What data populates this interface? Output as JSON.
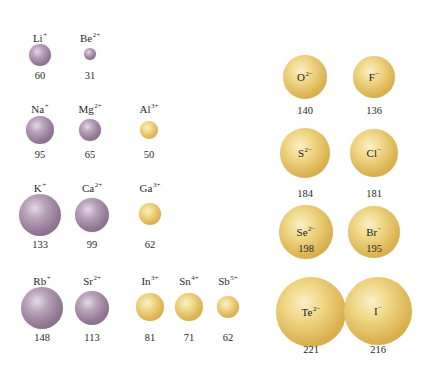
{
  "chart_data": {
    "type": "diagram",
    "title": "",
    "units": "pm",
    "cations": [
      {
        "symbol": "Li",
        "charge": "+",
        "radius": 60,
        "color": "purple",
        "x": 40,
        "y": 55,
        "r": 11,
        "label_y": 32,
        "value_y": 71
      },
      {
        "symbol": "Be",
        "charge": "2+",
        "radius": 31,
        "color": "purple",
        "x": 90,
        "y": 54,
        "r": 6,
        "label_y": 32,
        "value_y": 71
      },
      {
        "symbol": "Na",
        "charge": "+",
        "radius": 95,
        "color": "purple",
        "x": 40,
        "y": 130,
        "r": 14,
        "label_y": 103,
        "value_y": 150
      },
      {
        "symbol": "Mg",
        "charge": "2+",
        "radius": 65,
        "color": "purple",
        "x": 90,
        "y": 130,
        "r": 11,
        "label_y": 103,
        "value_y": 150
      },
      {
        "symbol": "Al",
        "charge": "3+",
        "radius": 50,
        "color": "gold",
        "x": 149,
        "y": 130,
        "r": 9,
        "label_y": 103,
        "value_y": 150
      },
      {
        "symbol": "K",
        "charge": "+",
        "radius": 133,
        "color": "purple",
        "x": 40,
        "y": 215,
        "r": 21,
        "label_y": 182,
        "value_y": 240
      },
      {
        "symbol": "Ca",
        "charge": "2+",
        "radius": 99,
        "color": "purple",
        "x": 92,
        "y": 215,
        "r": 17,
        "label_y": 182,
        "value_y": 240
      },
      {
        "symbol": "Ga",
        "charge": "3+",
        "radius": 62,
        "color": "gold",
        "x": 150,
        "y": 214,
        "r": 11,
        "label_y": 182,
        "value_y": 240
      },
      {
        "symbol": "Rb",
        "charge": "+",
        "radius": 148,
        "color": "purple",
        "x": 42,
        "y": 308,
        "r": 21,
        "label_y": 275,
        "value_y": 333
      },
      {
        "symbol": "Sr",
        "charge": "2+",
        "radius": 113,
        "color": "purple",
        "x": 92,
        "y": 308,
        "r": 17,
        "label_y": 275,
        "value_y": 333
      },
      {
        "symbol": "In",
        "charge": "3+",
        "radius": 81,
        "color": "gold",
        "x": 150,
        "y": 307,
        "r": 14,
        "label_y": 275,
        "value_y": 333
      },
      {
        "symbol": "Sn",
        "charge": "4+",
        "radius": 71,
        "color": "gold",
        "x": 189,
        "y": 307,
        "r": 14,
        "label_y": 275,
        "value_y": 333
      },
      {
        "symbol": "Sb",
        "charge": "5+",
        "radius": 62,
        "color": "gold",
        "x": 228,
        "y": 307,
        "r": 11,
        "label_y": 275,
        "value_y": 333
      }
    ],
    "anions": [
      {
        "symbol": "O",
        "charge": "2−",
        "radius": 140,
        "x": 305,
        "y": 77,
        "r": 22,
        "value_y": 106
      },
      {
        "symbol": "F",
        "charge": "−",
        "radius": 136,
        "x": 374,
        "y": 77,
        "r": 21,
        "value_y": 106
      },
      {
        "symbol": "S",
        "charge": "2−",
        "radius": 184,
        "x": 305,
        "y": 153,
        "r": 25,
        "value_y": 189
      },
      {
        "symbol": "Cl",
        "charge": "−",
        "radius": 181,
        "x": 374,
        "y": 153,
        "r": 24,
        "value_y": 189
      },
      {
        "symbol": "Se",
        "charge": "2−",
        "radius": 198,
        "x": 306,
        "y": 232,
        "r": 27,
        "value_y": 244
      },
      {
        "symbol": "Br",
        "charge": "−",
        "radius": 195,
        "x": 374,
        "y": 232,
        "r": 26,
        "value_y": 244
      },
      {
        "symbol": "Te",
        "charge": "2−",
        "radius": 221,
        "x": 311,
        "y": 312,
        "r": 35,
        "value_y": 345
      },
      {
        "symbol": "I",
        "charge": "−",
        "radius": 216,
        "x": 378,
        "y": 311,
        "r": 34,
        "value_y": 345
      }
    ]
  }
}
